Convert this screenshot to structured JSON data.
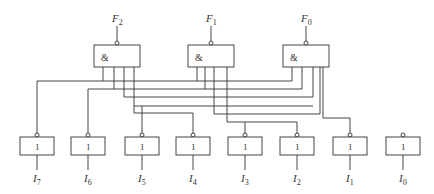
{
  "diagram": {
    "type": "logic-circuit",
    "colors": {
      "line": "#444444",
      "background": "#ffffff"
    },
    "outputs": [
      {
        "id": "F2",
        "label": "F",
        "sub": "2",
        "gate_symbol": "&"
      },
      {
        "id": "F1",
        "label": "F",
        "sub": "1",
        "gate_symbol": "&"
      },
      {
        "id": "F0",
        "label": "F",
        "sub": "0",
        "gate_symbol": "&"
      }
    ],
    "inverters": [
      {
        "id": "I7",
        "label": "I",
        "sub": "7",
        "gate_symbol": "1"
      },
      {
        "id": "I6",
        "label": "I",
        "sub": "6",
        "gate_symbol": "1"
      },
      {
        "id": "I5",
        "label": "I",
        "sub": "5",
        "gate_symbol": "1"
      },
      {
        "id": "I4",
        "label": "I",
        "sub": "4",
        "gate_symbol": "1"
      },
      {
        "id": "I3",
        "label": "I",
        "sub": "3",
        "gate_symbol": "1"
      },
      {
        "id": "I2",
        "label": "I",
        "sub": "2",
        "gate_symbol": "1"
      },
      {
        "id": "I1",
        "label": "I",
        "sub": "1",
        "gate_symbol": "1"
      },
      {
        "id": "I0",
        "label": "I",
        "sub": "0",
        "gate_symbol": "1"
      }
    ]
  }
}
